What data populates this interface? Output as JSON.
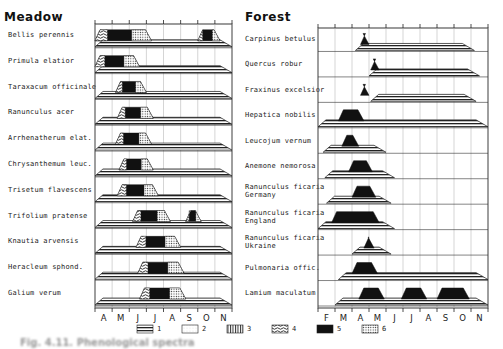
{
  "panels": {
    "meadow": {
      "title": "Meadow",
      "months": [
        "A",
        "M",
        "J",
        "J",
        "A",
        "S",
        "O",
        "N"
      ],
      "species": [
        "Bellis perennis",
        "Primula elatior",
        "Taraxacum officinale",
        "Ranunculus acer",
        "Arrhenatherum elat.",
        "Chrysanthemum leuc.",
        "Trisetum flavescens",
        "Trifolium pratense",
        "Knautia arvensis",
        "Heracleum sphond.",
        "Galium verum"
      ]
    },
    "forest": {
      "title": "Forest",
      "months": [
        "F",
        "M",
        "A",
        "M",
        "J",
        "J",
        "A",
        "S",
        "O",
        "N"
      ],
      "species": [
        "Carpinus betulus",
        "Quercus robur",
        "Fraxinus excelsior",
        "Hepatica nobilis",
        "Leucojum vernum",
        "Anemone nemorosa",
        "Ranunculus ficaria\nGermany",
        "Ranunculus ficaria\nEngland",
        "Ranunculus ficaria\nUkraine",
        "Pulmonaria offic.",
        "Lamium maculatum"
      ]
    }
  },
  "legend": [
    {
      "key": "1",
      "pattern": "horizontal-lines"
    },
    {
      "key": "2",
      "pattern": "light-stipple"
    },
    {
      "key": "3",
      "pattern": "vertical-lines"
    },
    {
      "key": "4",
      "pattern": "wavy-hatch"
    },
    {
      "key": "5",
      "pattern": "solid-black"
    },
    {
      "key": "6",
      "pattern": "dotted-grid"
    }
  ],
  "caption": "Fig. 4.11. Phenological spectra",
  "chart_data": [
    {
      "type": "table",
      "title": "Meadow",
      "x_axis": {
        "months": [
          "Apr",
          "May",
          "Jun",
          "Jul",
          "Aug",
          "Sep",
          "Oct",
          "Nov"
        ],
        "start_month_index": 4
      },
      "note": "Values are month positions (4 = start of April). Leaf band = pattern 1 trapezoid; flowering = patterns 4/5/6 trapezoid above it.",
      "rows": [
        {
          "species": "Bellis perennis",
          "leaf": [
            4.0,
            12.0
          ],
          "flower": [
            [
              4.0,
              7.3
            ],
            [
              10.0,
              11.3
            ]
          ]
        },
        {
          "species": "Primula elatior",
          "leaf": [
            4.0,
            12.0
          ],
          "flower": [
            [
              4.0,
              6.6
            ]
          ]
        },
        {
          "species": "Taraxacum officinale",
          "leaf": [
            4.0,
            12.0
          ],
          "flower": [
            [
              5.2,
              7.0
            ]
          ]
        },
        {
          "species": "Ranunculus acer",
          "leaf": [
            4.0,
            12.0
          ],
          "flower": [
            [
              5.3,
              7.4
            ]
          ]
        },
        {
          "species": "Arrhenatherum elat.",
          "leaf": [
            4.0,
            12.0
          ],
          "flower": [
            [
              5.2,
              7.3
            ]
          ]
        },
        {
          "species": "Chrysanthemum leuc.",
          "leaf": [
            4.0,
            12.0
          ],
          "flower": [
            [
              5.4,
              7.4
            ]
          ]
        },
        {
          "species": "Trisetum flavescens",
          "leaf": [
            4.0,
            12.0
          ],
          "flower": [
            [
              5.3,
              7.7
            ]
          ]
        },
        {
          "species": "Trifolium pratense",
          "leaf": [
            4.0,
            12.0
          ],
          "flower": [
            [
              6.2,
              8.4
            ],
            [
              9.3,
              10.2
            ]
          ]
        },
        {
          "species": "Knautia arvensis",
          "leaf": [
            4.0,
            12.0
          ],
          "flower": [
            [
              6.4,
              9.0
            ]
          ]
        },
        {
          "species": "Heracleum sphond.",
          "leaf": [
            4.0,
            12.0
          ],
          "flower": [
            [
              6.5,
              9.2
            ]
          ]
        },
        {
          "species": "Galium verum",
          "leaf": [
            4.0,
            12.0
          ],
          "flower": [
            [
              6.6,
              9.3
            ]
          ]
        }
      ]
    },
    {
      "type": "table",
      "title": "Forest",
      "x_axis": {
        "months": [
          "Feb",
          "Mar",
          "Apr",
          "May",
          "Jun",
          "Jul",
          "Aug",
          "Sep",
          "Oct",
          "Nov"
        ],
        "start_month_index": 2
      },
      "rows": [
        {
          "species": "Carpinus betulus",
          "leaf": [
            4.2,
            11.2
          ],
          "flower": [
            [
              4.5,
              5.0
            ]
          ]
        },
        {
          "species": "Quercus robur",
          "leaf": [
            5.0,
            11.5
          ],
          "flower": [
            [
              5.1,
              5.6
            ]
          ]
        },
        {
          "species": "Fraxinus excelsior",
          "leaf": [
            5.1,
            11.3
          ],
          "flower": [
            [
              4.5,
              5.0
            ]
          ]
        },
        {
          "species": "Hepatica nobilis",
          "leaf": [
            2.0,
            12.0
          ],
          "flower": [
            [
              3.2,
              4.7
            ]
          ]
        },
        {
          "species": "Leucojum vernum",
          "leaf": [
            2.3,
            6.0
          ],
          "flower": [
            [
              3.4,
              4.4
            ]
          ]
        },
        {
          "species": "Anemone nemorosa",
          "leaf": [
            2.4,
            6.5
          ],
          "flower": [
            [
              3.8,
              5.2
            ]
          ]
        },
        {
          "species": "Ranunculus ficaria Germany",
          "leaf": [
            2.5,
            6.3
          ],
          "flower": [
            [
              4.0,
              5.4
            ]
          ]
        },
        {
          "species": "Ranunculus ficaria England",
          "leaf": [
            2.0,
            6.5
          ],
          "flower": [
            [
              2.8,
              5.6
            ]
          ]
        },
        {
          "species": "Ranunculus ficaria Ukraine",
          "leaf": [
            4.0,
            6.3
          ],
          "flower": [
            [
              4.7,
              5.3
            ]
          ]
        },
        {
          "species": "Pulmonaria offic.",
          "leaf": [
            3.2,
            12.0
          ],
          "flower": [
            [
              4.0,
              5.5
            ]
          ]
        },
        {
          "species": "Lamium maculatum",
          "leaf": [
            3.0,
            12.0
          ],
          "flower": [
            [
              4.4,
              5.9
            ],
            [
              6.9,
              8.4
            ],
            [
              9.0,
              10.9
            ]
          ]
        }
      ]
    }
  ]
}
